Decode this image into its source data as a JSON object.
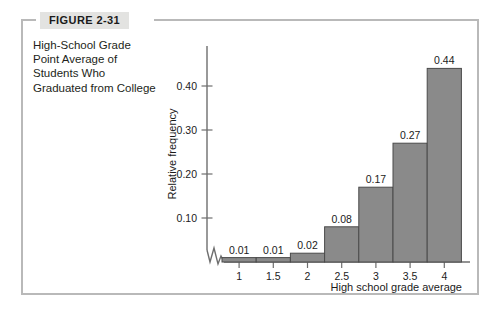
{
  "figure": {
    "tag_label": "FIGURE 2-31",
    "caption": "High-School Grade Point Average of Students Who Graduated from College",
    "frame_color": "#b9b9b9",
    "tag_background": "#e3e3e1"
  },
  "chart_data": {
    "type": "bar",
    "title": "",
    "xlabel": "High school grade average",
    "ylabel": "Relative frequency",
    "categories": [
      "1",
      "1.5",
      "2",
      "2.5",
      "3",
      "3.5",
      "4"
    ],
    "values": [
      0.01,
      0.01,
      0.02,
      0.08,
      0.17,
      0.27,
      0.44
    ],
    "value_labels": [
      "0.01",
      "0.01",
      "0.02",
      "0.08",
      "0.17",
      "0.27",
      "0.44"
    ],
    "ytick_labels": [
      "0.10",
      "0.20",
      "0.30",
      "0.40"
    ],
    "ytick_values": [
      0.1,
      0.2,
      0.3,
      0.4
    ],
    "ylim": [
      0,
      0.48
    ],
    "grid": false,
    "legend": false,
    "axis_break": true,
    "bar_color": "#8a8a8a",
    "bar_edge_color": "#4a4a4a",
    "axis_color": "#6e6e6e"
  }
}
